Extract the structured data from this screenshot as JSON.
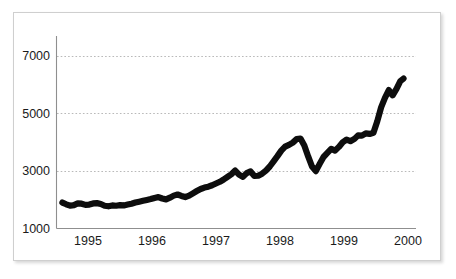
{
  "chart_data": {
    "type": "line",
    "title": "",
    "subtitle": "",
    "xlabel": "",
    "ylabel": "",
    "xlim": [
      1994.55,
      2000.0
    ],
    "ylim": [
      1000,
      7600
    ],
    "grid": true,
    "legend": null,
    "legend_position": "none",
    "x_ticks": [
      "1995",
      "1996",
      "1997",
      "1998",
      "1999",
      "2000"
    ],
    "x_tick_values": [
      1995,
      1996,
      1997,
      1998,
      1999,
      2000
    ],
    "y_ticks": [
      "1000",
      "3000",
      "5000",
      "7000"
    ],
    "y_tick_values": [
      1000,
      3000,
      5000,
      7000
    ],
    "line_color": "#0d0d0d",
    "grid_color": "#b9b9b9",
    "axis_color": "#8f8f8f",
    "series": [
      {
        "name": "index",
        "x": [
          1994.6,
          1994.66,
          1994.72,
          1994.78,
          1994.84,
          1994.9,
          1994.96,
          1995.02,
          1995.08,
          1995.14,
          1995.2,
          1995.26,
          1995.32,
          1995.38,
          1995.44,
          1995.5,
          1995.56,
          1995.62,
          1995.68,
          1995.74,
          1995.8,
          1995.86,
          1995.92,
          1995.98,
          1996.04,
          1996.1,
          1996.16,
          1996.22,
          1996.28,
          1996.34,
          1996.4,
          1996.46,
          1996.52,
          1996.58,
          1996.64,
          1996.7,
          1996.76,
          1996.82,
          1996.88,
          1996.94,
          1997.0,
          1997.06,
          1997.12,
          1997.18,
          1997.24,
          1997.3,
          1997.36,
          1997.42,
          1997.48,
          1997.54,
          1997.6,
          1997.66,
          1997.72,
          1997.78,
          1997.84,
          1997.9,
          1997.96,
          1998.02,
          1998.08,
          1998.14,
          1998.2,
          1998.26,
          1998.32,
          1998.38,
          1998.44,
          1998.5,
          1998.56,
          1998.62,
          1998.68,
          1998.74,
          1998.8,
          1998.86,
          1998.92,
          1998.98,
          1999.04,
          1999.1,
          1999.16,
          1999.22,
          1999.28,
          1999.34,
          1999.4,
          1999.46,
          1999.52,
          1999.58,
          1999.64,
          1999.7,
          1999.76,
          1999.82,
          1999.88,
          1999.93
        ],
        "y": [
          1900,
          1840,
          1790,
          1810,
          1870,
          1860,
          1820,
          1830,
          1870,
          1880,
          1850,
          1790,
          1770,
          1800,
          1790,
          1810,
          1800,
          1830,
          1860,
          1900,
          1930,
          1960,
          1990,
          2020,
          2060,
          2090,
          2040,
          2010,
          2070,
          2140,
          2180,
          2130,
          2090,
          2140,
          2220,
          2300,
          2370,
          2420,
          2450,
          2500,
          2560,
          2620,
          2700,
          2790,
          2880,
          3010,
          2870,
          2790,
          2920,
          2980,
          2820,
          2830,
          2900,
          3010,
          3150,
          3330,
          3510,
          3700,
          3840,
          3900,
          3980,
          4100,
          4120,
          3880,
          3500,
          3150,
          2990,
          3240,
          3480,
          3620,
          3760,
          3700,
          3830,
          3990,
          4080,
          4030,
          4100,
          4230,
          4220,
          4300,
          4280,
          4320,
          4720,
          5200,
          5530,
          5800,
          5620,
          5840,
          6110,
          6200
        ]
      }
    ]
  }
}
